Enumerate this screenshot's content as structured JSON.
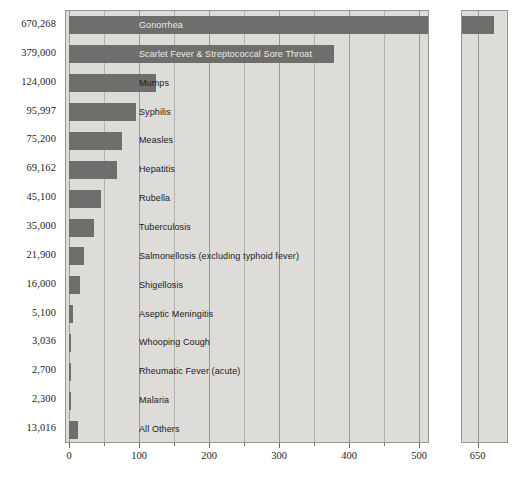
{
  "chart_data": {
    "type": "bar",
    "orientation": "horizontal",
    "title": "",
    "xlabel": "",
    "ylabel": "",
    "units": "thousands of cases",
    "xlim": [
      0,
      500
    ],
    "xticks": [
      0,
      100,
      200,
      300,
      400,
      500
    ],
    "xticklabels": [
      "0",
      "100",
      "200",
      "300",
      "400",
      "500"
    ],
    "minor_tick_step": 50,
    "grid": true,
    "legend": "none",
    "break_panel": {
      "label": "650",
      "xlim": [
        630,
        690
      ],
      "gridline_value": 650,
      "note": "broken-axis continuation panel for the Gonorrhea bar"
    },
    "categories": [
      "Gonorrhea",
      "Scarlet Fever & Streptococcal Sore Throat",
      "Mumps",
      "Syphilis",
      "Measles",
      "Hepatitis",
      "Rubella",
      "Tuberculosis",
      "Salmonellosis (excluding typhoid fever)",
      "Shigellosis",
      "Aseptic Meningitis",
      "Whooping Cough",
      "Rheumatic Fever (acute)",
      "Malaria",
      "All Others"
    ],
    "value_labels": [
      "670,268",
      "379,000",
      "124,000",
      "95,997",
      "75,200",
      "69,162",
      "45,100",
      "35,000",
      "21,900",
      "16,000",
      "5,100",
      "3,036",
      "2,700",
      "2,300",
      "13,016"
    ],
    "values": [
      670.268,
      379.0,
      124.0,
      95.997,
      75.2,
      69.162,
      45.1,
      35.0,
      21.9,
      16.0,
      5.1,
      3.036,
      2.7,
      2.3,
      13.016
    ],
    "label_on_bar": [
      true,
      true,
      false,
      false,
      false,
      false,
      false,
      false,
      false,
      false,
      false,
      false,
      false,
      false,
      false
    ],
    "colors": {
      "bar": "#6e6e6c",
      "panel_background": "#dddcd8",
      "panel_border": "#96948f",
      "gridline": "#9a9892",
      "gridline_minor": "#b4b2ac",
      "text": "#231f20",
      "text_on_bar": "#eceae6",
      "page_background": "#ffffff"
    }
  }
}
